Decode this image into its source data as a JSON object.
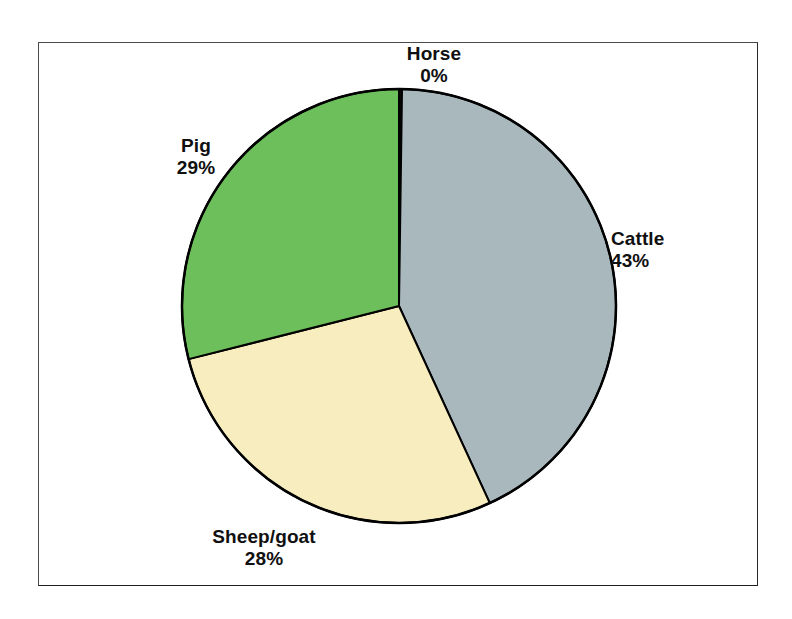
{
  "page": {
    "background_color": "#ffffff",
    "width": 792,
    "height": 619
  },
  "frame": {
    "border_color": "#2b2b2b",
    "background_color": "#ffffff"
  },
  "chart_data": {
    "type": "pie",
    "title": "",
    "subtitle": "",
    "xlabel": "",
    "ylabel": "",
    "legend_position": "none",
    "labels_position": "outside",
    "grid": false,
    "start_angle_deg": 0,
    "direction": "clockwise",
    "categories": [
      "Horse",
      "Cattle",
      "Sheep/goat",
      "Pig"
    ],
    "values": [
      0,
      43,
      28,
      29
    ],
    "value_suffix": "%",
    "colors": [
      "#0a0a0a",
      "#a9b8bc",
      "#f7edbe",
      "#6cbf5a"
    ],
    "slice_border_color": "#000000",
    "slices": [
      {
        "name": "Horse",
        "value": 0,
        "display_value": "0%",
        "color": "#0a0a0a",
        "label_name": "Horse",
        "label_value": "0%"
      },
      {
        "name": "Cattle",
        "value": 43,
        "display_value": "43%",
        "color": "#a9b8bc",
        "label_name": "Cattle",
        "label_value": "43%"
      },
      {
        "name": "Sheep/goat",
        "value": 28,
        "display_value": "28%",
        "color": "#f7edbe",
        "label_name": "Sheep/goat",
        "label_value": "28%"
      },
      {
        "name": "Pig",
        "value": 29,
        "display_value": "29%",
        "color": "#6cbf5a",
        "label_name": "Pig",
        "label_value": "29%"
      }
    ]
  }
}
